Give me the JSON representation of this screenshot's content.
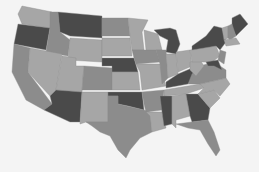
{
  "map": {
    "title": "",
    "type": "choropleth",
    "region": "United States (contiguous)",
    "colors": {
      "dark": "#4a4a4a",
      "mid": "#8c8c8c",
      "light": "#a6a6a6",
      "background": "#f4f4f4"
    },
    "states": [
      {
        "id": "WA",
        "shade": "light"
      },
      {
        "id": "OR",
        "shade": "dark"
      },
      {
        "id": "CA",
        "shade": "mid"
      },
      {
        "id": "ID",
        "shade": "mid"
      },
      {
        "id": "NV",
        "shade": "light"
      },
      {
        "id": "MT",
        "shade": "dark"
      },
      {
        "id": "WY",
        "shade": "light"
      },
      {
        "id": "UT",
        "shade": "light"
      },
      {
        "id": "AZ",
        "shade": "dark"
      },
      {
        "id": "CO",
        "shade": "mid"
      },
      {
        "id": "NM",
        "shade": "light"
      },
      {
        "id": "ND",
        "shade": "mid"
      },
      {
        "id": "SD",
        "shade": "light"
      },
      {
        "id": "NE",
        "shade": "dark"
      },
      {
        "id": "KS",
        "shade": "light"
      },
      {
        "id": "OK",
        "shade": "dark"
      },
      {
        "id": "TX",
        "shade": "mid"
      },
      {
        "id": "MN",
        "shade": "light"
      },
      {
        "id": "IA",
        "shade": "mid"
      },
      {
        "id": "MO",
        "shade": "light"
      },
      {
        "id": "AR",
        "shade": "mid"
      },
      {
        "id": "LA",
        "shade": "light"
      },
      {
        "id": "WI",
        "shade": "light"
      },
      {
        "id": "IL",
        "shade": "mid"
      },
      {
        "id": "MI",
        "shade": "dark"
      },
      {
        "id": "IN",
        "shade": "light"
      },
      {
        "id": "OH",
        "shade": "light"
      },
      {
        "id": "KY",
        "shade": "dark"
      },
      {
        "id": "TN",
        "shade": "light"
      },
      {
        "id": "MS",
        "shade": "dark"
      },
      {
        "id": "AL",
        "shade": "light"
      },
      {
        "id": "GA",
        "shade": "dark"
      },
      {
        "id": "FL",
        "shade": "mid"
      },
      {
        "id": "SC",
        "shade": "light"
      },
      {
        "id": "NC",
        "shade": "light"
      },
      {
        "id": "VA",
        "shade": "mid"
      },
      {
        "id": "WV",
        "shade": "light"
      },
      {
        "id": "PA",
        "shade": "light"
      },
      {
        "id": "NY",
        "shade": "dark"
      },
      {
        "id": "ME",
        "shade": "dark"
      },
      {
        "id": "VT",
        "shade": "light"
      },
      {
        "id": "NH",
        "shade": "mid"
      },
      {
        "id": "MA",
        "shade": "light"
      },
      {
        "id": "NJ",
        "shade": "mid"
      },
      {
        "id": "MD",
        "shade": "dark"
      }
    ],
    "footer_text": ""
  }
}
